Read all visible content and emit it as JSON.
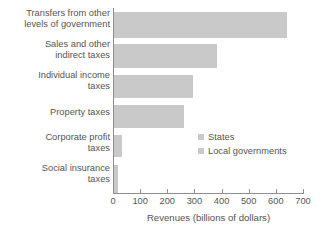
{
  "chart_data": {
    "type": "bar",
    "orientation": "horizontal",
    "title": "",
    "xlabel": "Revenues (billions of dollars)",
    "ylabel": "",
    "xlim": [
      0,
      700
    ],
    "xticks": [
      0,
      100,
      200,
      300,
      400,
      500,
      600,
      700
    ],
    "xtick_labels": [
      "0",
      "100",
      "200",
      "300",
      "400",
      "500",
      "600",
      "700"
    ],
    "grid": false,
    "categories": [
      "Transfers from other\nlevels of government",
      "Sales and other\nindirect taxes",
      "Individual income\ntaxes",
      "Property taxes",
      "Corporate profit\ntaxes",
      "Social insurance\ntaxes"
    ],
    "values": [
      638,
      380,
      291,
      258,
      30,
      14
    ],
    "bar_color": "#c9c9c9",
    "axis_color": "#8e8e8e",
    "text_color": "#555555",
    "legend": {
      "position": "middle-right",
      "entries": [
        {
          "label": "States",
          "color": "#c9c9c9"
        },
        {
          "label": "Local governments",
          "color": "#c9c9c9"
        }
      ]
    }
  }
}
